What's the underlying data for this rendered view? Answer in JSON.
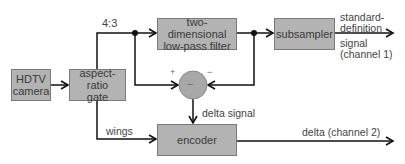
{
  "diagram": {
    "blocks": {
      "camera": "HDTV camera",
      "camera_line1": "HDTV",
      "camera_line2": "camera",
      "gate_line1": "aspect-ratio",
      "gate_line2": "gate",
      "filter_line1": "two-dimensional",
      "filter_line2": "low-pass filter",
      "subsampler": "subsampler",
      "encoder": "encoder",
      "subtractor_sign": "−"
    },
    "labels": {
      "ratio": "4:3",
      "wings": "wings",
      "plus": "+",
      "minus": "−",
      "delta_signal": "delta signal",
      "output1_line1": "standard-",
      "output1_line2": "definition",
      "output1_line3": "signal",
      "output1_line4": "(channel 1)",
      "output2": "delta (channel 2)"
    },
    "colors": {
      "block_fill": "#b3b3b3",
      "circle_fill": "#a8a8a8",
      "line": "#111111"
    }
  }
}
